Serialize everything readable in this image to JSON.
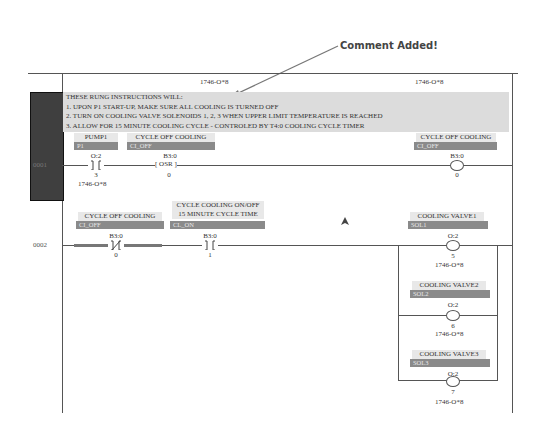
{
  "annotation": {
    "callout_text": "Comment Added!"
  },
  "header": {
    "module_label_left": "1746-O*8",
    "module_label_right": "1746-O*8"
  },
  "rung_comment": {
    "lines": [
      "THESE RUNG INSTRUCTIONS WILL:",
      "1.  UPON P1 START-UP, MAKE SURE ALL COOLING IS TURNED OFF",
      "2.  TURN ON COOLING VALVE SOLENOIDS 1, 2, 3 WHEN UPPER LIMIT TEMPERATURE IS REACHED",
      "3.  ALLOW FOR 15 MINUTE COOLING CYCLE - CONTROLED BY T4:0 COOLING CYCLE TIMER"
    ]
  },
  "rungs": [
    {
      "number": "0001",
      "instructions": [
        {
          "type": "XIC",
          "description": "PUMP1",
          "symbol": "P1",
          "address_top": "O:2",
          "bit": "3",
          "module": "1746-O*8"
        },
        {
          "type": "OSR",
          "description": "CYCLE OFF COOLING",
          "symbol": "CI_OFF",
          "address_top": "B3:0",
          "label": "OSR",
          "bit": "0"
        },
        {
          "type": "OTE",
          "description": "CYCLE OFF COOLING",
          "symbol": "CI_OFF",
          "address_top": "B3:0",
          "bit": "0"
        }
      ]
    },
    {
      "number": "0002",
      "instructions": [
        {
          "type": "XIO",
          "description": "CYCLE OFF COOLING",
          "symbol": "CI_OFF",
          "address_top": "B3:0",
          "bit": "0"
        },
        {
          "type": "XIC",
          "description_line1": "CYCLE COOLING ON/OFF",
          "description_line2": "15 MINUTE CYCLE TIME",
          "symbol": "CL_ON",
          "address_top": "B3:0",
          "bit": "1"
        },
        {
          "type": "OTE",
          "description": "COOLING VALVE1",
          "symbol": "SOL1",
          "address_top": "O:2",
          "bit": "5",
          "module": "1746-O*8"
        },
        {
          "type": "OTE",
          "description": "COOLING VALVE2",
          "symbol": "SOL2",
          "address_top": "O:2",
          "bit": "6",
          "module": "1746-O*8"
        },
        {
          "type": "OTE",
          "description": "COOLING VALVE3",
          "symbol": "SOL3",
          "address_top": "O:2",
          "bit": "7",
          "module": "1746-O*8"
        }
      ]
    }
  ]
}
